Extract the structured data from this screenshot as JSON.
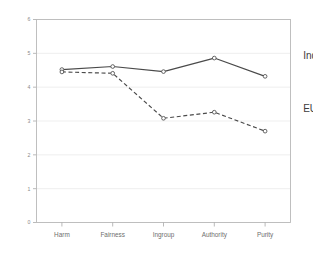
{
  "chart_data": {
    "type": "line",
    "title": "",
    "subtitle": "",
    "xlabel": "",
    "ylabel": "",
    "categories": [
      "Harm",
      "Fairness",
      "Ingroup",
      "Authority",
      "Purity"
    ],
    "ylim": [
      0,
      6
    ],
    "y_ticks": [
      0,
      1,
      2,
      3,
      4,
      5,
      6
    ],
    "y_tick_labels": [
      "0",
      "1",
      "2",
      "3",
      "4",
      "5",
      "6"
    ],
    "grid": true,
    "legend_position": "inline-right",
    "series": [
      {
        "name": "Indien",
        "style": "solid",
        "marker": "open-circle",
        "color": "#4a4a4a",
        "values": [
          4.52,
          4.61,
          4.46,
          4.86,
          4.32
        ],
        "label_x": 5.25,
        "label_y": 4.95
      },
      {
        "name": "EU",
        "style": "dashed",
        "marker": "open-circle",
        "color": "#4a4a4a",
        "values": [
          4.45,
          4.41,
          3.08,
          3.26,
          2.7
        ],
        "label_x": 5.25,
        "label_y": 3.36
      }
    ]
  },
  "colors": {
    "background": "#ffffff",
    "frame": "#b9b9b9",
    "grid": "#e8e8e8",
    "series": "#4a4a4a",
    "tick_text": "#8a8a8a",
    "category_text": "#6e6e6e"
  }
}
